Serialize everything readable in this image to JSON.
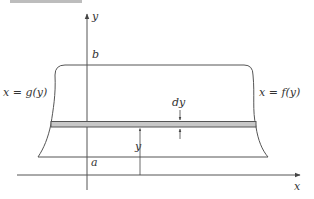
{
  "figure": {
    "axes": {
      "x_label": "x",
      "y_label": "y"
    },
    "bounds": {
      "upper_label": "b",
      "lower_label": "a"
    },
    "curves": {
      "left_label": "x = g(y)",
      "right_label": "x = f(y)"
    },
    "strip": {
      "thickness_label": "dy",
      "height_label": "y"
    },
    "colors": {
      "line": "#555555",
      "strip_fill": "#c8c8c8",
      "top_bar": "#bdbdbd",
      "text": "#333333"
    }
  }
}
